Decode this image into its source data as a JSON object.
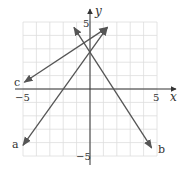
{
  "chart_data": {
    "type": "line",
    "title": "",
    "xlabel": "x",
    "ylabel": "y",
    "xlim": [
      -5,
      5
    ],
    "ylim": [
      -5,
      5
    ],
    "grid": true,
    "tick_labels": {
      "x_min": "−5",
      "x_max": "5",
      "y_max": "5",
      "y_min": "−5"
    },
    "series": [
      {
        "name": "a",
        "label": "a",
        "x": [
          -5,
          1.3
        ],
        "y": [
          -4.2,
          4.6
        ],
        "equation_estimate": "y = 1.5x + 3"
      },
      {
        "name": "b",
        "label": "b",
        "x": [
          -1.2,
          4.6
        ],
        "y": [
          4.6,
          -4.4
        ],
        "equation_estimate": "y = -1.5x + 3"
      },
      {
        "name": "c",
        "label": "c",
        "x": [
          -4.9,
          1.3
        ],
        "y": [
          0.5,
          4.6
        ],
        "equation_estimate": "y = 0.65x + 3.7"
      }
    ]
  },
  "colors": {
    "line": "#555555",
    "grid": "#dddddd",
    "axis": "#333333"
  }
}
